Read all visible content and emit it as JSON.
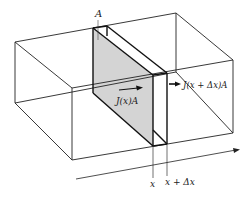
{
  "diagram": {
    "labels": {
      "area": "A",
      "flux_in": "J(x)A",
      "flux_out": "J(x + Δx)A",
      "x_left": "x",
      "x_right": "x + Δx"
    },
    "colors": {
      "line": "#222222",
      "slab_fill": "#d4d4d4",
      "background": "#ffffff"
    }
  }
}
